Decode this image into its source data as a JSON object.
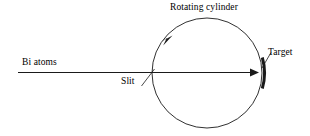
{
  "figure": {
    "background_color": "#ffffff",
    "stroke_color": "#1a1a1a",
    "width": 310,
    "height": 136
  },
  "labels": {
    "rotating_cylinder": "Rotating cylinder",
    "bi_atoms": "Bi atoms",
    "slit": "Slit",
    "target": "Target"
  },
  "geometry": {
    "circle": {
      "cx": 207,
      "cy": 73,
      "r": 55,
      "stroke_width": 0.9
    },
    "beam": {
      "x1": 18,
      "y1": 72.5,
      "x2": 258,
      "y2": 72.5,
      "stroke_width": 1.1
    },
    "rotation_arrow": {
      "x": 168,
      "y": 41,
      "direction": "clockwise"
    },
    "target_arc": {
      "x": 262,
      "y_top": 57,
      "y_bottom": 87,
      "stroke_width": 3
    },
    "slit_leader": {
      "x1": 142,
      "y1": 86,
      "x2": 154,
      "y2": 70
    },
    "target_leader": {
      "x1": 262,
      "y1": 68,
      "x2": 272,
      "y2": 52
    }
  },
  "icons": {
    "beam_arrowhead": "arrow-right-icon",
    "rotation_arrowhead": "arrow-clockwise-icon"
  }
}
